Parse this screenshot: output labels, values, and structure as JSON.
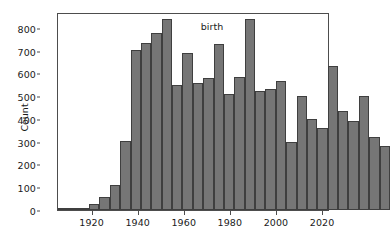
{
  "chart_data": {
    "type": "bar",
    "subtype": "histogram",
    "title": "",
    "xlabel": "birth",
    "ylabel": "Count",
    "xlim": [
      1905,
      2023
    ],
    "ylim": [
      0,
      870
    ],
    "grid": false,
    "legend": null,
    "bar_color": "#767676",
    "bar_edge_color": "#3f3f3f",
    "bin_width": 4.5,
    "xticks": [
      1920,
      1940,
      1960,
      1980,
      2000,
      2020
    ],
    "xtick_labels": [
      "1920",
      "1940",
      "1960",
      "1980",
      "2000",
      "2020"
    ],
    "yticks": [
      0,
      100,
      200,
      300,
      400,
      500,
      600,
      700,
      800
    ],
    "ytick_labels": [
      "0",
      "100",
      "200",
      "300",
      "400",
      "500",
      "600",
      "700",
      "800"
    ],
    "bins": [
      {
        "x0": 1905.0,
        "x1": 1909.5,
        "value": 2
      },
      {
        "x0": 1909.5,
        "x1": 1914.0,
        "value": 2
      },
      {
        "x0": 1914.0,
        "x1": 1918.5,
        "value": 4
      },
      {
        "x0": 1918.5,
        "x1": 1923.0,
        "value": 25
      },
      {
        "x0": 1923.0,
        "x1": 1927.5,
        "value": 57
      },
      {
        "x0": 1927.5,
        "x1": 1932.0,
        "value": 112
      },
      {
        "x0": 1932.0,
        "x1": 1936.5,
        "value": 305
      },
      {
        "x0": 1936.5,
        "x1": 1941.0,
        "value": 705
      },
      {
        "x0": 1941.0,
        "x1": 1945.5,
        "value": 732
      },
      {
        "x0": 1945.5,
        "x1": 1950.0,
        "value": 778
      },
      {
        "x0": 1950.0,
        "x1": 1954.5,
        "value": 840
      },
      {
        "x0": 1954.5,
        "x1": 1959.0,
        "value": 550
      },
      {
        "x0": 1959.0,
        "x1": 1963.5,
        "value": 692
      },
      {
        "x0": 1963.5,
        "x1": 1968.0,
        "value": 558
      },
      {
        "x0": 1968.0,
        "x1": 1972.5,
        "value": 581
      },
      {
        "x0": 1972.5,
        "x1": 1977.0,
        "value": 729
      },
      {
        "x0": 1977.0,
        "x1": 1981.5,
        "value": 510
      },
      {
        "x0": 1981.5,
        "x1": 1986.0,
        "value": 584
      },
      {
        "x0": 1986.0,
        "x1": 1990.5,
        "value": 838
      },
      {
        "x0": 1990.5,
        "x1": 1995.0,
        "value": 524
      },
      {
        "x0": 1995.0,
        "x1": 1999.5,
        "value": 532
      },
      {
        "x0": 1999.5,
        "x1": 2004.0,
        "value": 567
      },
      {
        "x0": 2004.0,
        "x1": 2008.5,
        "value": 300
      },
      {
        "x0": 2008.5,
        "x1": 2013.0,
        "value": 503
      },
      {
        "x0": 2013.0,
        "x1": 2017.5,
        "value": 399
      },
      {
        "x0": 2017.5,
        "x1": 2022.0,
        "value": 359
      },
      {
        "x0": 2022.0,
        "x1": 2026.5,
        "value": 633
      },
      {
        "x0": 2026.5,
        "x1": 2031.0,
        "value": 437
      },
      {
        "x0": 2031.0,
        "x1": 2035.5,
        "value": 390
      },
      {
        "x0": 2035.5,
        "x1": 2040.0,
        "value": 501
      },
      {
        "x0": 2040.0,
        "x1": 2044.5,
        "value": 320
      },
      {
        "x0": 2044.5,
        "x1": 2049.0,
        "value": 282
      }
    ],
    "values": [
      2,
      2,
      4,
      25,
      57,
      112,
      305,
      705,
      732,
      778,
      840,
      550,
      692,
      558,
      581,
      729,
      510,
      584,
      838,
      524,
      532,
      567,
      300,
      503,
      399,
      359,
      633,
      437,
      390,
      501,
      320,
      282
    ]
  }
}
